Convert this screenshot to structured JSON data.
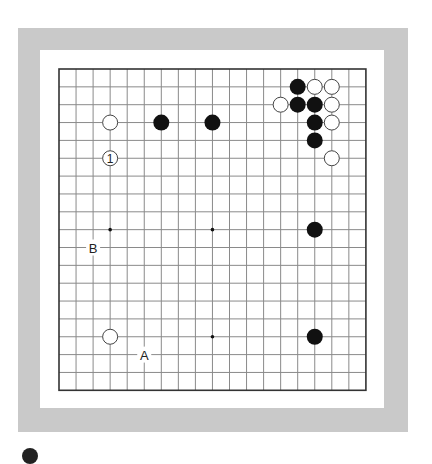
{
  "board": {
    "size": 19,
    "origin_x": 59,
    "origin_y": 69,
    "spacing_x": 17.05,
    "spacing_y": 17.85,
    "stone_radius": 8,
    "colors": {
      "frame": "#c9c9c9",
      "grid_line": "#8a8a8a",
      "border_line": "#333333",
      "black_stone": "#111111",
      "white_stone_fill": "#ffffff",
      "white_stone_edge": "#444444"
    },
    "star_points_visible": [
      {
        "col": 3,
        "row": 9
      },
      {
        "col": 9,
        "row": 9
      },
      {
        "col": 9,
        "row": 15
      }
    ],
    "stones": [
      {
        "color": "black",
        "col": 14,
        "row": 1
      },
      {
        "color": "white",
        "col": 15,
        "row": 1
      },
      {
        "color": "white",
        "col": 16,
        "row": 1
      },
      {
        "color": "white",
        "col": 13,
        "row": 2
      },
      {
        "color": "black",
        "col": 14,
        "row": 2
      },
      {
        "color": "black",
        "col": 15,
        "row": 2
      },
      {
        "color": "white",
        "col": 16,
        "row": 2
      },
      {
        "color": "black",
        "col": 15,
        "row": 3
      },
      {
        "color": "white",
        "col": 16,
        "row": 3
      },
      {
        "color": "black",
        "col": 15,
        "row": 4
      },
      {
        "color": "white",
        "col": 16,
        "row": 5
      },
      {
        "color": "white",
        "col": 3,
        "row": 3
      },
      {
        "color": "black",
        "col": 6,
        "row": 3
      },
      {
        "color": "black",
        "col": 9,
        "row": 3
      },
      {
        "color": "white",
        "col": 3,
        "row": 5,
        "label": "1"
      },
      {
        "color": "black",
        "col": 15,
        "row": 9
      },
      {
        "color": "white",
        "col": 3,
        "row": 15
      },
      {
        "color": "black",
        "col": 15,
        "row": 15
      }
    ],
    "point_labels": [
      {
        "text": "B",
        "col": 2,
        "row": 10
      },
      {
        "text": "A",
        "col": 5,
        "row": 16
      }
    ]
  },
  "footer": {
    "marker": "black-stone-icon"
  }
}
